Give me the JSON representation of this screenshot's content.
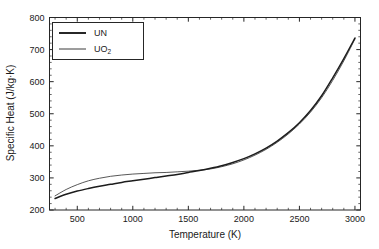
{
  "figure": {
    "background_color": "#ffffff",
    "axis_color": "#262626"
  },
  "chart_data": {
    "type": "line",
    "title": "",
    "xlabel": "Temperature (K)",
    "ylabel": "Specific Heat (J/kg·K)",
    "xlim": [
      250,
      3050
    ],
    "ylim": [
      200,
      800
    ],
    "xticks": [
      500,
      1000,
      1500,
      2000,
      2500,
      3000
    ],
    "yticks": [
      200,
      300,
      400,
      500,
      600,
      700,
      800
    ],
    "xtick_labels": [
      "500",
      "1000",
      "1500",
      "2000",
      "2500",
      "3000"
    ],
    "ytick_labels": [
      "200",
      "300",
      "400",
      "500",
      "600",
      "700",
      "800"
    ],
    "x_minor_interval": 100,
    "y_minor_interval": 20,
    "grid": false,
    "legend_position": "upper left",
    "ticks_direction": "in",
    "frame": "full-box",
    "x": [
      300,
      400,
      500,
      600,
      700,
      800,
      900,
      1000,
      1100,
      1200,
      1300,
      1400,
      1500,
      1600,
      1700,
      1800,
      1900,
      2000,
      2100,
      2200,
      2300,
      2400,
      2500,
      2600,
      2700,
      2800,
      2900,
      3000
    ],
    "series": [
      {
        "name": "UN",
        "color": "#1c1c1c",
        "line_width": 1.5,
        "values": [
          236,
          249,
          259,
          267,
          274,
          280,
          286,
          291,
          296,
          301,
          306,
          311,
          317,
          323,
          330,
          338,
          348,
          360,
          375,
          393,
          415,
          441,
          472,
          510,
          556,
          612,
          672,
          736
        ]
      },
      {
        "name": "UO2",
        "label_base": "UO",
        "label_subscript": "2",
        "color": "#3a3a3a",
        "line_width": 0.85,
        "values": [
          244,
          264,
          279,
          291,
          299,
          305,
          309,
          312,
          314,
          316,
          317,
          319,
          321,
          324,
          328,
          335,
          344,
          356,
          371,
          389,
          411,
          437,
          468,
          505,
          550,
          604,
          665,
          733
        ]
      }
    ]
  },
  "legend": {
    "entries": [
      {
        "label": "UN",
        "sublabel": ""
      },
      {
        "label": "UO",
        "sublabel": "2"
      }
    ]
  }
}
